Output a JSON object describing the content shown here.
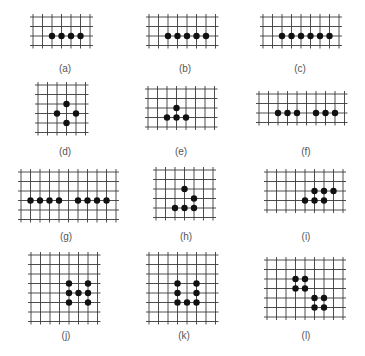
{
  "figure": {
    "style": {
      "grid_color": "#3a3a3a",
      "dot_color": "#111111",
      "label_color": "#555555",
      "spacing": 9.5,
      "dot_radius": 3.2,
      "overhang": 3
    },
    "panels": [
      {
        "id": "a",
        "label": "(a)",
        "origin": [
          33,
          17
        ],
        "cols": 7,
        "rows": 4,
        "dots": [
          [
            1,
            1
          ],
          [
            2,
            1
          ],
          [
            3,
            1
          ],
          [
            4,
            1
          ]
        ],
        "label_pos": [
          65,
          63
        ]
      },
      {
        "id": "b",
        "label": "(b)",
        "origin": [
          149,
          17
        ],
        "cols": 8,
        "rows": 4,
        "dots": [
          [
            1,
            1
          ],
          [
            2,
            1
          ],
          [
            3,
            1
          ],
          [
            4,
            1
          ],
          [
            5,
            1
          ]
        ],
        "label_pos": [
          185,
          63
        ]
      },
      {
        "id": "c",
        "label": "(c)",
        "origin": [
          263,
          17
        ],
        "cols": 9,
        "rows": 4,
        "dots": [
          [
            1,
            1
          ],
          [
            2,
            1
          ],
          [
            3,
            1
          ],
          [
            4,
            1
          ],
          [
            5,
            1
          ],
          [
            6,
            1
          ]
        ],
        "label_pos": [
          300,
          63
        ]
      },
      {
        "id": "d",
        "label": "(d)",
        "origin": [
          38,
          85
        ],
        "cols": 6,
        "rows": 6,
        "dots": [
          [
            2,
            1
          ],
          [
            1,
            2
          ],
          [
            3,
            2
          ],
          [
            2,
            3
          ]
        ],
        "label_pos": [
          65,
          146
        ]
      },
      {
        "id": "e",
        "label": "(e)",
        "origin": [
          148,
          89
        ],
        "cols": 8,
        "rows": 5,
        "dots": [
          [
            2,
            1
          ],
          [
            1,
            2
          ],
          [
            2,
            2
          ],
          [
            3,
            2
          ]
        ],
        "label_pos": [
          181,
          146
        ]
      },
      {
        "id": "f",
        "label": "(f)",
        "origin": [
          259,
          94
        ],
        "cols": 10,
        "rows": 4,
        "dots": [
          [
            1,
            1
          ],
          [
            2,
            1
          ],
          [
            3,
            1
          ],
          [
            5,
            1
          ],
          [
            6,
            1
          ],
          [
            7,
            1
          ]
        ],
        "label_pos": [
          306,
          146
        ]
      },
      {
        "id": "g",
        "label": "(g)",
        "origin": [
          21,
          172
        ],
        "cols": 11,
        "rows": 6,
        "dots": [
          [
            0,
            2
          ],
          [
            1,
            2
          ],
          [
            2,
            2
          ],
          [
            3,
            2
          ],
          [
            5,
            2
          ],
          [
            6,
            2
          ],
          [
            7,
            2
          ],
          [
            8,
            2
          ]
        ],
        "label_pos": [
          66,
          231
        ]
      },
      {
        "id": "h",
        "label": "(h)",
        "origin": [
          156,
          170
        ],
        "cols": 7,
        "rows": 6,
        "dots": [
          [
            2,
            1
          ],
          [
            3,
            2
          ],
          [
            1,
            3
          ],
          [
            2,
            3
          ],
          [
            3,
            3
          ]
        ],
        "label_pos": [
          186,
          231
        ]
      },
      {
        "id": "i",
        "label": "(i)",
        "origin": [
          267,
          172
        ],
        "cols": 9,
        "rows": 5,
        "dots": [
          [
            4,
            1
          ],
          [
            5,
            1
          ],
          [
            6,
            1
          ],
          [
            3,
            2
          ],
          [
            4,
            2
          ],
          [
            5,
            2
          ]
        ],
        "label_pos": [
          306,
          231
        ]
      },
      {
        "id": "j",
        "label": "(j)",
        "origin": [
          31,
          255
        ],
        "cols": 8,
        "rows": 8,
        "dots": [
          [
            3,
            2
          ],
          [
            5,
            2
          ],
          [
            3,
            3
          ],
          [
            4,
            3
          ],
          [
            5,
            3
          ],
          [
            3,
            4
          ],
          [
            5,
            4
          ]
        ],
        "label_pos": [
          66,
          330
        ]
      },
      {
        "id": "k",
        "label": "(k)",
        "origin": [
          149,
          255
        ],
        "cols": 8,
        "rows": 8,
        "dots": [
          [
            2,
            2
          ],
          [
            4,
            2
          ],
          [
            2,
            3
          ],
          [
            4,
            3
          ],
          [
            2,
            4
          ],
          [
            3,
            4
          ],
          [
            4,
            4
          ]
        ],
        "label_pos": [
          184,
          330
        ]
      },
      {
        "id": "l",
        "label": "(l)",
        "origin": [
          267,
          260
        ],
        "cols": 9,
        "rows": 7,
        "dots": [
          [
            2,
            1
          ],
          [
            3,
            1
          ],
          [
            2,
            2
          ],
          [
            3,
            2
          ],
          [
            4,
            3
          ],
          [
            5,
            3
          ],
          [
            4,
            4
          ],
          [
            5,
            4
          ]
        ],
        "label_pos": [
          306,
          330
        ]
      }
    ]
  }
}
